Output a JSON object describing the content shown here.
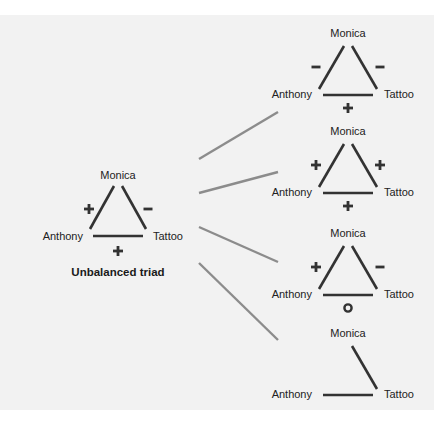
{
  "colors": {
    "background": "#f2f2f2",
    "edge": "#333333",
    "connector": "#8c8c8c",
    "text": "#222222"
  },
  "source": {
    "title": "Unbalanced triad",
    "nodes": {
      "top": "Monica",
      "left": "Anthony",
      "right": "Tattoo"
    },
    "signs": {
      "left_edge": "+",
      "right_edge": "-",
      "base": "+"
    }
  },
  "outcomes": [
    {
      "nodes": {
        "top": "Monica",
        "left": "Anthony",
        "right": "Tattoo"
      },
      "signs": {
        "left_edge": "-",
        "right_edge": "-",
        "base": "+"
      },
      "edges": {
        "left": true,
        "right": true,
        "base": true
      }
    },
    {
      "nodes": {
        "top": "Monica",
        "left": "Anthony",
        "right": "Tattoo"
      },
      "signs": {
        "left_edge": "+",
        "right_edge": "+",
        "base": "+"
      },
      "edges": {
        "left": true,
        "right": true,
        "base": true
      }
    },
    {
      "nodes": {
        "top": "Monica",
        "left": "Anthony",
        "right": "Tattoo"
      },
      "signs": {
        "left_edge": "+",
        "right_edge": "-",
        "base": "0"
      },
      "edges": {
        "left": true,
        "right": true,
        "base": true
      }
    },
    {
      "nodes": {
        "top": "Monica",
        "left": "Anthony",
        "right": "Tattoo"
      },
      "signs": {
        "left_edge": "",
        "right_edge": "",
        "base": ""
      },
      "edges": {
        "left": false,
        "right": true,
        "base": true
      }
    }
  ],
  "connectors": [
    {
      "x1": 199,
      "y1": 159,
      "x2": 278,
      "y2": 112
    },
    {
      "x1": 199,
      "y1": 193,
      "x2": 278,
      "y2": 172
    },
    {
      "x1": 199,
      "y1": 227,
      "x2": 278,
      "y2": 262
    },
    {
      "x1": 199,
      "y1": 263,
      "x2": 278,
      "y2": 340
    }
  ]
}
